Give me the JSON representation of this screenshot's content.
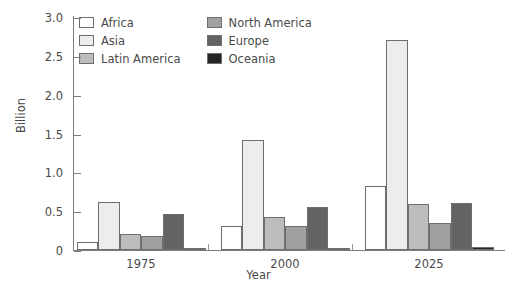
{
  "chart_data": {
    "type": "bar",
    "title": "",
    "xlabel": "Year",
    "ylabel": "Billion",
    "categories": [
      "1975",
      "2000",
      "2025"
    ],
    "ylim": [
      0,
      3.0
    ],
    "yticks": [
      "0",
      "0.5",
      "1.0",
      "1.5",
      "2.0",
      "2.5",
      "3.0"
    ],
    "ytick_values": [
      0,
      0.5,
      1.0,
      1.5,
      2.0,
      2.5,
      3.0
    ],
    "grid": false,
    "legend_position": "top-left",
    "series": [
      {
        "name": "Africa",
        "color": "#ffffff",
        "values": [
          0.1,
          0.31,
          0.82
        ]
      },
      {
        "name": "Asia",
        "color": "#ededed",
        "values": [
          0.62,
          1.42,
          2.7
        ]
      },
      {
        "name": "Latin America",
        "color": "#bdbdbd",
        "values": [
          0.2,
          0.42,
          0.59
        ]
      },
      {
        "name": "North America",
        "color": "#a0a0a0",
        "values": [
          0.18,
          0.31,
          0.35
        ]
      },
      {
        "name": "Europe",
        "color": "#636363",
        "values": [
          0.47,
          0.56,
          0.61
        ]
      },
      {
        "name": "Oceania",
        "color": "#252525",
        "values": [
          0.02,
          0.03,
          0.04
        ]
      }
    ]
  }
}
